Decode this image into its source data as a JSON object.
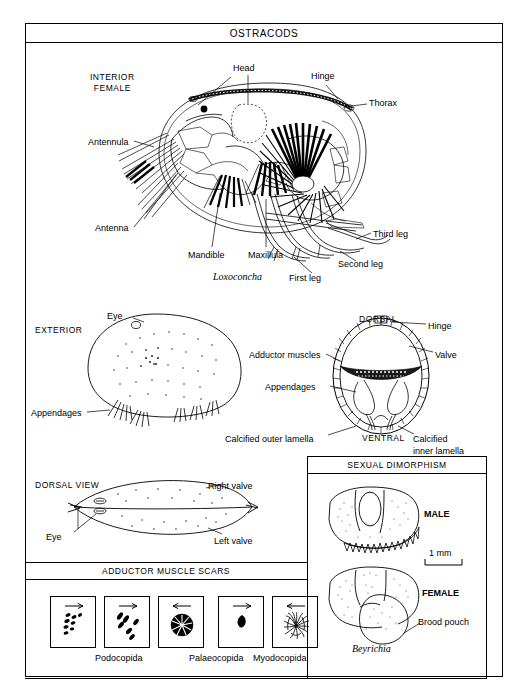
{
  "plate": {
    "title": "OSTRACODS"
  },
  "interior": {
    "view_label": "INTERIOR\nFEMALE",
    "genus": "Loxoconcha",
    "labels": {
      "head": "Head",
      "hinge": "Hinge",
      "thorax": "Thorax",
      "antennula": "Antennula",
      "antenna": "Antenna",
      "mandible": "Mandible",
      "maxillula": "Maxillula",
      "first_leg": "First leg",
      "second_leg": "Second leg",
      "third_leg": "Third leg"
    }
  },
  "exterior": {
    "view_label": "EXTERIOR",
    "labels": {
      "eye": "Eye",
      "appendages": "Appendages"
    }
  },
  "cross_section": {
    "labels": {
      "dorsal": "DORSAL",
      "ventral": "VENTRAL",
      "hinge": "Hinge",
      "valve": "Valve",
      "adductor_muscles": "Adductor muscles",
      "appendages": "Appendages",
      "outer_lamella": "Calcified outer lamella",
      "inner_lamella": "Calcified\ninner lamella"
    }
  },
  "dorsal_view": {
    "view_label": "DORSAL VIEW",
    "labels": {
      "right_valve": "Right valve",
      "left_valve": "Left valve",
      "eye": "Eye"
    }
  },
  "adductor_panel": {
    "title": "ADDUCTOR MUSCLE SCARS",
    "boxes": [
      {
        "pattern": "rows-of-small-scars",
        "arrow": "right"
      },
      {
        "pattern": "scattered-elongate-scars",
        "arrow": "right"
      },
      {
        "pattern": "rosette-cluster",
        "arrow": "left"
      },
      {
        "pattern": "single-scar",
        "arrow": "right"
      },
      {
        "pattern": "radial-streak-cluster",
        "arrow": "left"
      }
    ],
    "captions": [
      "Podocopida",
      "Palaeocopida",
      "Myodocopida"
    ]
  },
  "dimorphism_panel": {
    "title": "SEXUAL DIMORPHISM",
    "genus": "Beyrichia",
    "labels": {
      "male": "MALE",
      "female": "FEMALE",
      "brood_pouch": "Brood pouch",
      "scale": "1 mm"
    }
  },
  "colors": {
    "ink": "#000000",
    "paper": "#ffffff"
  }
}
